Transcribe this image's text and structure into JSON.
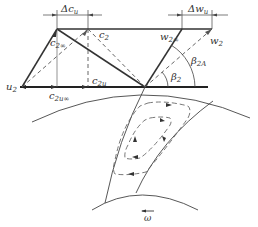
{
  "diagram": {
    "type": "centrifugal impeller outlet velocity triangle with slip",
    "labels": {
      "delta_cu": "Δc",
      "delta_cu_sub": "u",
      "delta_wu": "Δw",
      "delta_wu_sub": "u",
      "c2inf": "c",
      "c2inf_sub": "2∞",
      "c2": "c",
      "c2_sub": "2",
      "w2inf": "w",
      "w2inf_sub": "2∞",
      "w2": "w",
      "w2_sub": "2",
      "u2": "u",
      "u2_sub": "2",
      "c2u": "c",
      "c2u_sub": "2u",
      "c2uinf": "c",
      "c2uinf_sub": "2u∞",
      "beta2": "β",
      "beta2_sub": "2",
      "beta2A": "β",
      "beta2A_sub": "2A",
      "omega": "ω"
    },
    "colors": {
      "line": "#333333",
      "dashed": "#555555"
    }
  }
}
